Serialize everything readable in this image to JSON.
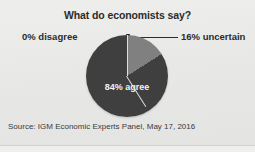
{
  "chart_data": {
    "type": "pie",
    "title": "What do economists say?",
    "categories": [
      "agree",
      "uncertain",
      "disagree"
    ],
    "values": [
      84,
      16,
      0
    ],
    "slices": [
      {
        "label": "84% agree",
        "category": "agree",
        "value": 84,
        "color": "#3f3f3f",
        "label_position": "inside",
        "label_color": "#f2f2f2"
      },
      {
        "label": "16% uncertain",
        "category": "uncertain",
        "value": 16,
        "color": "#808080",
        "label_position": "outside-right",
        "label_color": "#2b2b2b"
      },
      {
        "label": "0% disagree",
        "category": "disagree",
        "value": 0,
        "color": "none",
        "label_position": "outside-left",
        "label_color": "#2b2b2b"
      }
    ],
    "units": "percent",
    "start_angle_deg": 0,
    "direction": "clockwise",
    "legend": "none",
    "grid": false,
    "source": "Source: IGM Economic Experts Panel, May 17, 2016"
  },
  "figure": {
    "title": "What do economists say?",
    "source": "Source: IGM Economic Experts Panel, May 17, 2016",
    "background_color": "#e9e9e7"
  },
  "labels": {
    "agree": "84% agree",
    "uncertain": "16% uncertain",
    "disagree": "0% disagree"
  },
  "colors": {
    "agree_slice": "#3f3f3f",
    "uncertain_slice": "#808080",
    "text": "#2b2b2b",
    "inside_text": "#f2f2f2",
    "leader_line": "#2b2b2b",
    "background": "#e9e9e7"
  }
}
